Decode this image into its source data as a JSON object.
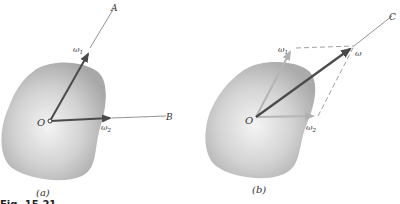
{
  "figure": {
    "caption": "Fig. 15.21",
    "panels": [
      {
        "id": "a",
        "label": "(a)",
        "origin_label": "O",
        "vectors": [
          {
            "name": "omega-1",
            "symbol": "ω",
            "subscript": "1",
            "axis_label": "A"
          },
          {
            "name": "omega-2",
            "symbol": "ω",
            "subscript": "2",
            "axis_label": "B"
          }
        ]
      },
      {
        "id": "b",
        "label": "(b)",
        "origin_label": "O",
        "vectors": [
          {
            "name": "omega-1",
            "symbol": "ω",
            "subscript": "1"
          },
          {
            "name": "omega-2",
            "symbol": "ω",
            "subscript": "2"
          },
          {
            "name": "omega-resultant",
            "symbol": "ω",
            "subscript": "",
            "axis_label": "C"
          }
        ]
      }
    ]
  },
  "colors": {
    "body_fill_light": "#f2f2f2",
    "body_fill_dark": "#a9a9a9",
    "vector_dark": "#555555",
    "vector_light": "#b5b5b5",
    "axis_line": "#777777"
  }
}
